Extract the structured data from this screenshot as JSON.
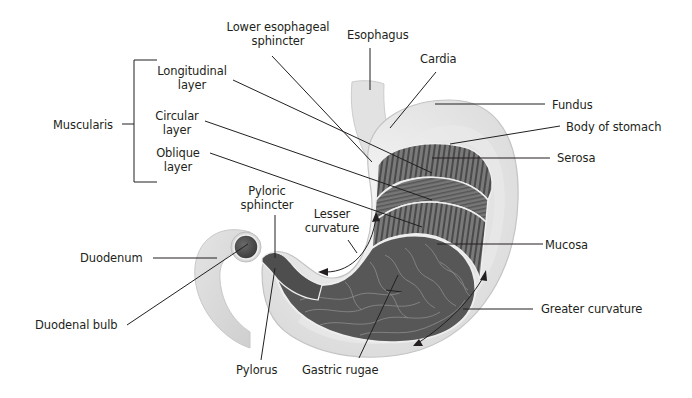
{
  "diagram": {
    "colors": {
      "background": "#ffffff",
      "text": "#231f20",
      "leader_line": "#231f20",
      "serosa_outer": "#dcdcdc",
      "serosa_light": "#ececec",
      "muscle_dark": "#6e6e6e",
      "muscle_stripe": "#4a4a4a",
      "mucosa": "#5c5c5c",
      "rugae": "#8e8e8e"
    },
    "labels": {
      "lower_esophageal_sphincter": [
        "Lower esophageal",
        "sphincter"
      ],
      "esophagus": "Esophagus",
      "cardia": "Cardia",
      "fundus": "Fundus",
      "body_of_stomach": "Body of stomach",
      "serosa": "Serosa",
      "muscularis": "Muscularis",
      "longitudinal_layer": [
        "Longitudinal",
        "layer"
      ],
      "circular_layer": [
        "Circular",
        "layer"
      ],
      "oblique_layer": [
        "Oblique",
        "layer"
      ],
      "pyloric_sphincter": [
        "Pyloric",
        "sphincter"
      ],
      "lesser_curvature": [
        "Lesser",
        "curvature"
      ],
      "mucosa": "Mucosa",
      "duodenum": "Duodenum",
      "duodenal_bulb": "Duodenal bulb",
      "greater_curvature": "Greater curvature",
      "pylorus": "Pylorus",
      "gastric_rugae": "Gastric rugae"
    }
  }
}
